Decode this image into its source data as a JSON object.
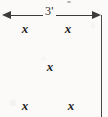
{
  "figure": {
    "width": 108,
    "height": 117,
    "background_color": "#fbfaf8",
    "ink_color": "#2e2e2e"
  },
  "dimension": {
    "label": "3'",
    "value": 3,
    "unit": "feet",
    "orientation": "horizontal",
    "arrow_style": "double-headed",
    "start_x": 4,
    "end_x": 101,
    "y": 15
  },
  "boundary": {
    "orientation": "vertical",
    "x": 101,
    "y_start": 15,
    "y_end": 117
  },
  "marks": [
    {
      "id": "mark-top-left",
      "glyph": "x",
      "x": 25,
      "y": 28,
      "row": "top",
      "column": "left"
    },
    {
      "id": "mark-top-right",
      "glyph": "x",
      "x": 68,
      "y": 28,
      "row": "top",
      "column": "right"
    },
    {
      "id": "mark-center",
      "glyph": "x",
      "x": 50,
      "y": 66,
      "row": "middle",
      "column": "center"
    },
    {
      "id": "mark-bottom-left",
      "glyph": "x",
      "x": 25,
      "y": 105,
      "row": "bottom",
      "column": "left"
    },
    {
      "id": "mark-bottom-right",
      "glyph": "x",
      "x": 71,
      "y": 105,
      "row": "bottom",
      "column": "right"
    }
  ]
}
